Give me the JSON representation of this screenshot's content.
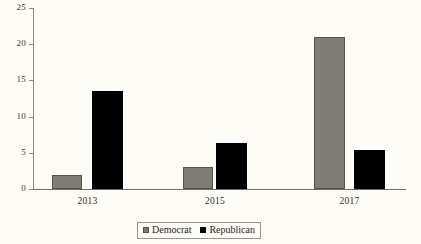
{
  "chart_data": {
    "type": "bar",
    "title": "",
    "xlabel": "",
    "ylabel": "",
    "categories": [
      "2013",
      "2015",
      "2017"
    ],
    "series": [
      {
        "name": "Democrat",
        "color": "#7e7e77",
        "values": [
          2,
          3,
          21
        ]
      },
      {
        "name": "Republican",
        "color": "#000000",
        "values": [
          13.5,
          6.3,
          5.4
        ]
      }
    ],
    "ylim": [
      0,
      25
    ],
    "ytick_values": [
      0,
      5,
      10,
      15,
      20,
      25
    ],
    "ytick_labels": [
      "0",
      "5",
      "10",
      "15",
      "20",
      "25"
    ],
    "grid": false,
    "legend_position": "bottom-center"
  },
  "axes": {
    "y_ticks": [
      {
        "label": "25",
        "value": 25
      },
      {
        "label": "20",
        "value": 20
      },
      {
        "label": "15",
        "value": 15
      },
      {
        "label": "10",
        "value": 10
      },
      {
        "label": "5",
        "value": 5
      },
      {
        "label": "0",
        "value": 0
      }
    ],
    "x_ticks": [
      {
        "label": "2013"
      },
      {
        "label": "2015"
      },
      {
        "label": "2017"
      }
    ]
  },
  "legend": {
    "entries": [
      {
        "label": "Democrat",
        "swatch": "gray-square-swatch"
      },
      {
        "label": "Republican",
        "swatch": "black-square-swatch"
      }
    ]
  },
  "bars": [
    {
      "group": "2013",
      "series": "Democrat",
      "value": 2,
      "x": 52,
      "width": 30
    },
    {
      "group": "2013",
      "series": "Republican",
      "value": 13.5,
      "x": 92,
      "width": 31
    },
    {
      "group": "2015",
      "series": "Democrat",
      "value": 3,
      "x": 183,
      "width": 30
    },
    {
      "group": "2015",
      "series": "Republican",
      "value": 6.3,
      "x": 216,
      "width": 31
    },
    {
      "group": "2017",
      "series": "Democrat",
      "value": 21,
      "x": 314,
      "width": 31
    },
    {
      "group": "2017",
      "series": "Republican",
      "value": 5.4,
      "x": 354,
      "width": 31
    }
  ],
  "colors": {
    "democrat": "#7e7e77",
    "republican": "#000000",
    "axis": "#8d8b80",
    "background": "#fdfcf6"
  }
}
